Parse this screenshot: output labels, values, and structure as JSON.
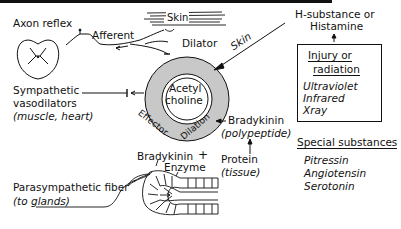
{
  "diagram": {
    "colors": {
      "ink": "#111111",
      "vessel_wall": "#c8c8c8",
      "background": "#ffffff"
    },
    "labels": {
      "axon_reflex": "Axon reflex",
      "afferent": "Afferent",
      "skin_top": "Skin",
      "dilator": "Dilator",
      "skin_arrow": "Skin",
      "sympathetic_1": "Sympathetic",
      "sympathetic_2": "vasodilators",
      "sympathetic_3": "(muscle, heart)",
      "acetyl": "Acetyl",
      "choline": "choline",
      "effector": "Effector",
      "dilation": "Dilation",
      "bradykinin_top": "Bradykinin",
      "polypeptide": "(polypeptide)",
      "bradykinin_bottom": "Bradykinin",
      "plus": "+",
      "enzyme": "Enzyme",
      "protein": "Protein",
      "tissue": "(tissue)",
      "parasympathetic_1": "Parasympathetic fiber",
      "parasympathetic_2": "(to glands)",
      "h_substance_1": "H-substance or",
      "h_substance_2": "Histamine"
    },
    "injury_box": {
      "title_1": "Injury or",
      "title_2": "radiation",
      "items": [
        "Ultraviolet",
        "Infrared",
        "Xray"
      ]
    },
    "special_substances": {
      "title": "Special substances",
      "items": [
        "Pitressin",
        "Angiotensin",
        "Serotonin"
      ]
    }
  }
}
